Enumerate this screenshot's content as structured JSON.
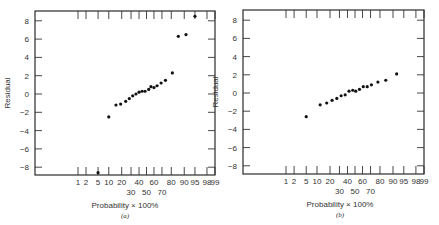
{
  "chart_data": [
    {
      "type": "scatter",
      "panel": "a",
      "caption": "(a)",
      "title": "",
      "xlabel": "Probability × 100%",
      "ylabel": "Residual",
      "ylim": [
        -9,
        9
      ],
      "y_ticks": [
        8,
        6,
        4,
        2,
        0,
        -2,
        -4,
        -6,
        -8
      ],
      "x_ticks_row1": [
        "1",
        "2",
        "5",
        "10",
        "20",
        "40",
        "60",
        "80",
        "90",
        "95",
        "98",
        "99"
      ],
      "x_ticks_row2": [
        "30",
        "50",
        "70"
      ],
      "x_scale": "normal probability",
      "grid": false,
      "points": [
        {
          "p": 5,
          "r": -8.6
        },
        {
          "p": 10,
          "r": -2.5
        },
        {
          "p": 15,
          "r": -1.2
        },
        {
          "p": 19,
          "r": -1.1
        },
        {
          "p": 24,
          "r": -0.8
        },
        {
          "p": 28,
          "r": -0.5
        },
        {
          "p": 32,
          "r": -0.2
        },
        {
          "p": 36,
          "r": 0.0
        },
        {
          "p": 40,
          "r": 0.2
        },
        {
          "p": 44,
          "r": 0.3
        },
        {
          "p": 48,
          "r": 0.3
        },
        {
          "p": 53,
          "r": 0.5
        },
        {
          "p": 56,
          "r": 0.8
        },
        {
          "p": 60,
          "r": 0.7
        },
        {
          "p": 64,
          "r": 0.9
        },
        {
          "p": 69,
          "r": 1.2
        },
        {
          "p": 74,
          "r": 1.5
        },
        {
          "p": 81,
          "r": 2.3
        },
        {
          "p": 86,
          "r": 6.3
        },
        {
          "p": 91,
          "r": 6.5
        },
        {
          "p": 95,
          "r": 8.5
        }
      ]
    },
    {
      "type": "scatter",
      "panel": "b",
      "caption": "(b)",
      "title": "",
      "xlabel": "Probability × 100%",
      "ylabel": "Residual",
      "ylim": [
        -9,
        9
      ],
      "y_ticks": [
        8,
        6,
        4,
        2,
        0,
        -2,
        -4,
        -6,
        -8
      ],
      "x_ticks_row1": [
        "1",
        "2",
        "5",
        "10",
        "20",
        "40",
        "60",
        "80",
        "90",
        "95",
        "98",
        "99"
      ],
      "x_ticks_row2": [
        "30",
        "50",
        "70"
      ],
      "x_scale": "normal probability",
      "grid": false,
      "points": [
        {
          "p": 5,
          "r": -2.6
        },
        {
          "p": 12,
          "r": -1.3
        },
        {
          "p": 17,
          "r": -1.1
        },
        {
          "p": 22,
          "r": -0.8
        },
        {
          "p": 27,
          "r": -0.6
        },
        {
          "p": 32,
          "r": -0.3
        },
        {
          "p": 37,
          "r": -0.2
        },
        {
          "p": 42,
          "r": 0.2
        },
        {
          "p": 47,
          "r": 0.3
        },
        {
          "p": 51,
          "r": 0.2
        },
        {
          "p": 56,
          "r": 0.4
        },
        {
          "p": 61,
          "r": 0.7
        },
        {
          "p": 66,
          "r": 0.7
        },
        {
          "p": 71,
          "r": 0.9
        },
        {
          "p": 78,
          "r": 1.2
        },
        {
          "p": 85,
          "r": 1.4
        },
        {
          "p": 92,
          "r": 2.1
        }
      ]
    }
  ]
}
